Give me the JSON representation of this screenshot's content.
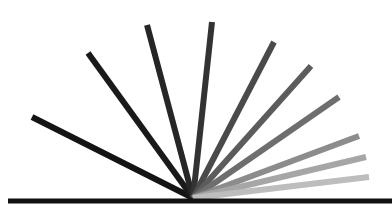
{
  "figure": {
    "origin": [
      193,
      198
    ],
    "baseline": {
      "x1": 8,
      "y1": 201,
      "x2": 392,
      "y2": 201,
      "width": 5,
      "color": "#111111"
    },
    "ray_width": 6,
    "rays": [
      {
        "x": 32,
        "y": 117,
        "color": "#141414"
      },
      {
        "x": 88,
        "y": 53,
        "color": "#1a1a1a"
      },
      {
        "x": 147,
        "y": 25,
        "color": "#262626"
      },
      {
        "x": 212,
        "y": 22,
        "color": "#333333"
      },
      {
        "x": 274,
        "y": 42,
        "color": "#4a4a4a"
      },
      {
        "x": 311,
        "y": 66,
        "color": "#5c5c5c"
      },
      {
        "x": 339,
        "y": 97,
        "color": "#6e6e6e"
      },
      {
        "x": 359,
        "y": 136,
        "color": "#8c8c8c"
      },
      {
        "x": 366,
        "y": 157,
        "color": "#a6a6a6"
      },
      {
        "x": 369,
        "y": 177,
        "color": "#bdbdbd"
      }
    ]
  }
}
